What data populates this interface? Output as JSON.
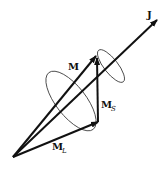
{
  "diagram": {
    "colors": {
      "stroke": "#111111",
      "ellipse": "#333333",
      "background": "#ffffff"
    },
    "origin": [
      13,
      157
    ],
    "vectors": [
      {
        "id": "J",
        "label": "J",
        "subscript": "",
        "tip": [
          157,
          20
        ],
        "label_pos": [
          147,
          18
        ]
      },
      {
        "id": "M",
        "label": "M",
        "subscript": "",
        "tip": [
          96,
          56
        ],
        "label_pos": [
          68,
          70
        ]
      },
      {
        "id": "M_L",
        "label": "M",
        "subscript": "L",
        "tip": [
          98,
          122
        ],
        "label_pos": [
          52,
          150
        ]
      },
      {
        "id": "M_S",
        "label": "M",
        "subscript": "S",
        "from": [
          98,
          122
        ],
        "tip": [
          96,
          56
        ],
        "label_pos": [
          101,
          108
        ]
      }
    ],
    "precession_ellipses": [
      {
        "name": "small-precession-cone",
        "center": [
          111,
          66
        ],
        "rx": 7,
        "ry": 20,
        "rotate": -38
      },
      {
        "name": "large-precession-cone",
        "center": [
          71,
          101
        ],
        "rx": 15,
        "ry": 36,
        "rotate": -38
      }
    ]
  }
}
